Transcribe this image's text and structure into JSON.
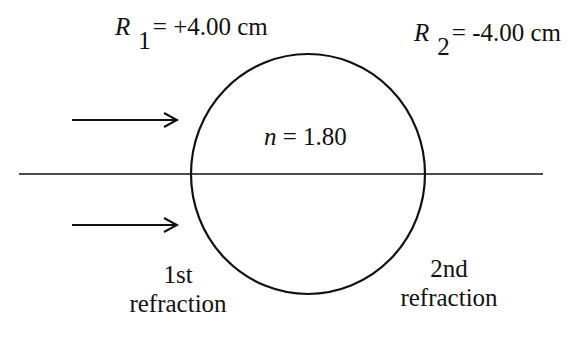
{
  "diagram": {
    "type": "optics-sphere-refraction",
    "surface1": {
      "symbol": "R",
      "subscript": "1",
      "value": "= +4.00 cm"
    },
    "surface2": {
      "symbol": "R",
      "subscript": "2",
      "value": "= -4.00 cm"
    },
    "medium": {
      "symbol": "n",
      "value": "= 1.80"
    },
    "labels": {
      "first": {
        "line1": "1st",
        "line2": "refraction"
      },
      "second": {
        "line1": "2nd",
        "line2": "refraction"
      }
    },
    "rays": 2,
    "colors": {
      "stroke": "#111111",
      "background": "#ffffff"
    }
  }
}
